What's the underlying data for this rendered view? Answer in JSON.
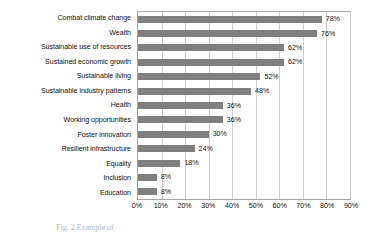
{
  "chart_data": {
    "type": "bar",
    "orientation": "horizontal",
    "title": "",
    "xlabel": "",
    "ylabel": "",
    "xlim": [
      0,
      90
    ],
    "xtick_labels": [
      "0%",
      "10%",
      "20%",
      "30%",
      "40%",
      "50%",
      "60%",
      "70%",
      "80%",
      "90%"
    ],
    "xticks": [
      0,
      10,
      20,
      30,
      40,
      50,
      60,
      70,
      80,
      90
    ],
    "grid": "vertical",
    "legend": "none",
    "bar_color": "#7f7f7f",
    "categories": [
      "Combat climate change",
      "Wealth",
      "Sustainable use of resources",
      "Sustained economic growth",
      "Sustainable living",
      "Sustainable industry patterns",
      "Health",
      "Working opportunities",
      "Foster innovation",
      "Resilient infrastructure",
      "Equality",
      "Inclusion",
      "Education"
    ],
    "values": [
      78,
      76,
      62,
      62,
      52,
      48,
      36,
      36,
      30,
      24,
      18,
      8,
      8
    ],
    "data_labels": [
      "78%",
      "76%",
      "62%",
      "62%",
      "52%",
      "48%",
      "36%",
      "36%",
      "30%",
      "24%",
      "18%",
      "8%",
      "8%"
    ]
  },
  "caption": {
    "text": "Fig. 2 Example of"
  }
}
